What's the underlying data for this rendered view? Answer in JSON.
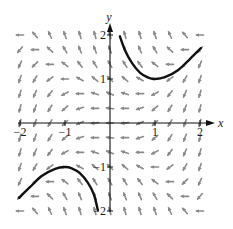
{
  "chart_data": {
    "type": "slope_field",
    "title": "",
    "equation": "dy/dx = x^2 - y^2",
    "xlabel": "x",
    "ylabel": "y",
    "xlim": [
      -2,
      2
    ],
    "ylim": [
      -2,
      2
    ],
    "x_ticks": [
      {
        "value": -2,
        "label": "−2"
      },
      {
        "value": -1,
        "label": "−1"
      },
      {
        "value": 1,
        "label": "1"
      },
      {
        "value": 2,
        "label": "2"
      }
    ],
    "y_ticks": [
      {
        "value": 2,
        "label": "2"
      },
      {
        "value": 1,
        "label": "1"
      },
      {
        "value": -1,
        "label": "−1"
      },
      {
        "value": -2,
        "label": "−2"
      }
    ],
    "grid": false,
    "field": {
      "x_start": -2,
      "x_end": 2,
      "x_step": 0.3333,
      "y_start": -2,
      "y_end": 2,
      "y_step": 0.3333,
      "color": "#8a8a8a"
    },
    "solution_curves": [
      {
        "name": "upper-solution",
        "color": "#111111",
        "points": [
          [
            0.22,
            1.97
          ],
          [
            0.33,
            1.66
          ],
          [
            0.49,
            1.36
          ],
          [
            0.67,
            1.14
          ],
          [
            0.85,
            1.03
          ],
          [
            1.0,
            1.0
          ],
          [
            1.22,
            1.04
          ],
          [
            1.51,
            1.2
          ],
          [
            1.78,
            1.46
          ],
          [
            2.02,
            1.7
          ]
        ]
      },
      {
        "name": "lower-solution",
        "color": "#111111",
        "points": [
          [
            -2.02,
            -1.7
          ],
          [
            -1.78,
            -1.46
          ],
          [
            -1.51,
            -1.2
          ],
          [
            -1.22,
            -1.04
          ],
          [
            -1.0,
            -1.0
          ],
          [
            -0.85,
            -1.03
          ],
          [
            -0.67,
            -1.14
          ],
          [
            -0.49,
            -1.36
          ],
          [
            -0.36,
            -1.62
          ],
          [
            -0.27,
            -1.98
          ]
        ]
      }
    ]
  },
  "layout": {
    "origin_px": [
      110,
      123
    ],
    "px_per_unit_x": 45,
    "px_per_unit_y": 44
  }
}
